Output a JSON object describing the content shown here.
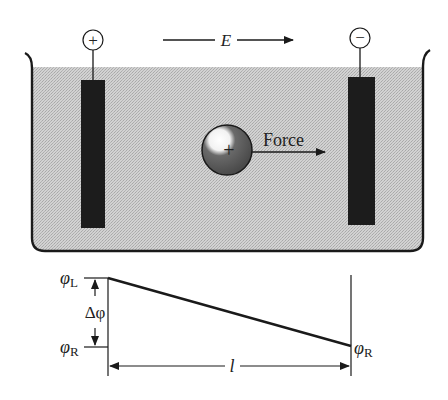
{
  "figure": {
    "field": {
      "label": "E",
      "direction": "right"
    },
    "electrodes": [
      {
        "id": "left",
        "terminal_symbol": "+",
        "polarity": "positive"
      },
      {
        "id": "right",
        "terminal_symbol": "−",
        "polarity": "negative"
      }
    ],
    "particle": {
      "charge_symbol": "+",
      "force_label": "Force"
    },
    "potential_plot": {
      "phi_left_label": "φ",
      "phi_left_sub": "L",
      "phi_right_label": "φ",
      "phi_right_sub": "R",
      "phi_right_left_label": "φ",
      "phi_right_left_sub": "R",
      "delta_label": "Δφ",
      "length_label": "l"
    },
    "colors": {
      "ink": "#1a1a1a",
      "solution": "#c9c9c9",
      "electrode": "#1c1c1c",
      "background": "#ffffff"
    }
  }
}
